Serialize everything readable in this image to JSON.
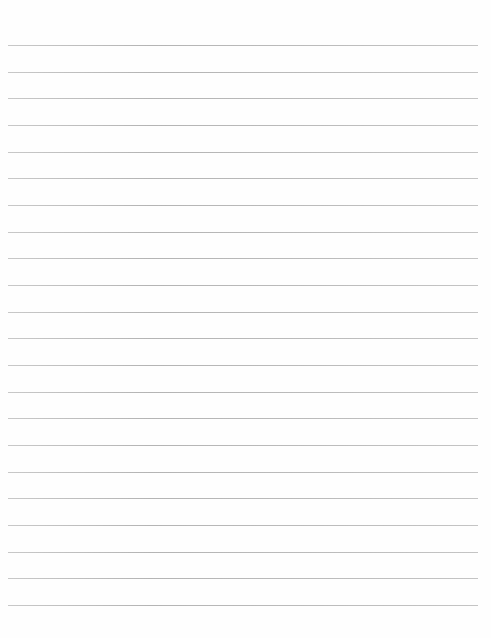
{
  "page": {
    "type": "lined-paper",
    "background_color": "#fefefe",
    "line_color": "#b8b8b8",
    "line_count": 22,
    "first_line_y": 45,
    "line_spacing": 26.67,
    "line_left": 8,
    "line_width": 470,
    "text": ""
  }
}
